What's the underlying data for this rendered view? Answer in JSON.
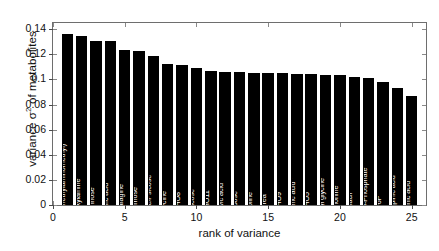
{
  "chart_data": {
    "type": "bar",
    "title": "",
    "xlabel": "rank of variance",
    "ylabel_prefix": "variance ",
    "ylabel_symbol": "σ",
    "ylabel_exponent": "2",
    "ylabel_suffix": " of metabolites",
    "ylabel_full": "variance σ² of metabolites",
    "xlim": [
      0,
      26
    ],
    "ylim": [
      0,
      0.145
    ],
    "ytick_labels": [
      "0",
      "0.02",
      "0.04",
      "0.06",
      "0.08",
      "0.1",
      "0.12",
      "0.14"
    ],
    "ytick_values": [
      0,
      0.02,
      0.04,
      0.06,
      0.08,
      0.1,
      0.12,
      0.14
    ],
    "xtick_labels": [
      "0",
      "5",
      "10",
      "15",
      "20",
      "25"
    ],
    "xtick_values": [
      0,
      5,
      10,
      15,
      20,
      25
    ],
    "grid": false,
    "legend": false,
    "bar_color": "#000000",
    "bar_label_color": "#ffffff",
    "axis_color": "#6e6e6e",
    "categories": [
      "'Tartronic acid 2-(methylaminomethyl)'",
      "'Hydroxylamine'",
      "'Mannose'",
      "'Glyceric acid '",
      "'Asparagine'",
      "'Raffinose'",
      "'Fructose/Psicose'",
      "'Glycine '",
      "'CHO8'",
      "'Glucose'",
      "'CHO11'",
      "'Pyruvic acid'",
      "'Ribose'",
      "'Proline '",
      "'Urea'",
      "'CHO9'",
      "'Glutamic acid '",
      "'CHO5'",
      "'Suberyl glycine'",
      "'Methionine '",
      "'Uracil'",
      "'Glucose-6-Phosphate'",
      "'F6P'",
      "'Iso-Sinapinic acid '",
      "'Threonic acid'"
    ],
    "values": [
      0.1365,
      0.1348,
      0.1308,
      0.1305,
      0.1232,
      0.1228,
      0.1185,
      0.112,
      0.1112,
      0.1095,
      0.1068,
      0.1062,
      0.1058,
      0.1055,
      0.1052,
      0.1048,
      0.1045,
      0.1042,
      0.1038,
      0.1032,
      0.1018,
      0.1008,
      0.098,
      0.0932,
      0.0872
    ],
    "ranks": [
      1,
      2,
      3,
      4,
      5,
      6,
      7,
      8,
      9,
      10,
      11,
      12,
      13,
      14,
      15,
      16,
      17,
      18,
      19,
      20,
      21,
      22,
      23,
      24,
      25
    ]
  }
}
